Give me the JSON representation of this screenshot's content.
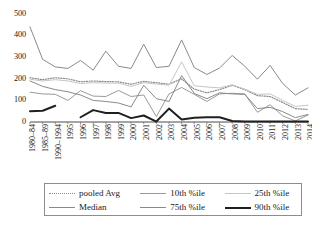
{
  "chart_data": {
    "type": "line",
    "title": "",
    "xlabel": "",
    "ylabel": "",
    "ylim": [
      0,
      500
    ],
    "yticks": [
      0,
      100,
      200,
      300,
      400,
      500
    ],
    "grid": false,
    "legend_position": "bottom",
    "categories": [
      "1980–84",
      "1985–89",
      "1990–1994",
      "1995",
      "1996",
      "1997",
      "1998",
      "1999",
      "2000",
      "2001",
      "2002",
      "2003",
      "2004",
      "2005",
      "2006",
      "2007",
      "2008",
      "2009",
      "2010",
      "2011",
      "2012",
      "2013",
      "2014"
    ],
    "series": [
      {
        "name": "pooled Avg",
        "style": "dotted",
        "color": "#8a8a8a",
        "width": 1.2,
        "values": [
          205,
          196,
          205,
          200,
          186,
          190,
          187,
          186,
          175,
          188,
          182,
          175,
          200,
          152,
          135,
          150,
          170,
          150,
          122,
          118,
          90,
          62,
          58
        ]
      },
      {
        "name": "10th %ile",
        "style": "solid",
        "color": "#9a9a9a",
        "width": 1.0,
        "values": [
          138,
          130,
          128,
          100,
          145,
          120,
          118,
          146,
          118,
          125,
          25,
          130,
          160,
          128,
          95,
          130,
          133,
          130,
          45,
          80,
          28,
          5,
          32
        ]
      },
      {
        "name": "25th %ile",
        "style": "solid",
        "color": "#c6c6c6",
        "width": 1.0,
        "values": [
          198,
          190,
          196,
          190,
          178,
          182,
          180,
          180,
          165,
          182,
          176,
          170,
          278,
          168,
          162,
          158,
          172,
          152,
          128,
          130,
          100,
          72,
          78
        ]
      },
      {
        "name": "Median",
        "style": "solid",
        "color": "#8a8a8a",
        "width": 1.0,
        "values": [
          190,
          165,
          150,
          140,
          125,
          100,
          95,
          88,
          70,
          170,
          108,
          95,
          215,
          132,
          108,
          135,
          130,
          128,
          62,
          68,
          48,
          20,
          35
        ]
      },
      {
        "name": "75th %ile",
        "style": "solid",
        "color": "#8a8a8a",
        "width": 1.0,
        "values": [
          440,
          290,
          255,
          248,
          285,
          240,
          328,
          258,
          248,
          360,
          252,
          258,
          380,
          252,
          220,
          250,
          308,
          258,
          198,
          262,
          178,
          125,
          158
        ]
      },
      {
        "name": "90th %ile",
        "style": "solid",
        "color": "#1f1f1f",
        "width": 2.0,
        "values": [
          50,
          52,
          75,
          null,
          22,
          55,
          42,
          42,
          18,
          30,
          2,
          62,
          12,
          20,
          22,
          22,
          5,
          2,
          2,
          2,
          2,
          2,
          2
        ]
      }
    ]
  },
  "legend": {
    "entries": [
      {
        "label": "pooled Avg"
      },
      {
        "label": "10th %ile"
      },
      {
        "label": "25th %ile"
      },
      {
        "label": "Median"
      },
      {
        "label": "75th %ile"
      },
      {
        "label": "90th %ile"
      }
    ]
  }
}
